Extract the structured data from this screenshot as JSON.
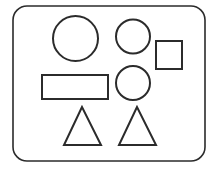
{
  "canvas": {
    "width": 214,
    "height": 169,
    "background": "#ffffff"
  },
  "style": {
    "stroke": "#2b2b2b",
    "stroke_width": 2,
    "fill": "#ffffff"
  },
  "frame": {
    "x": 13,
    "y": 6,
    "width": 192,
    "height": 155,
    "radius": 14
  },
  "shapes": {
    "circle_large": {
      "cx": 75.5,
      "cy": 38.5,
      "r": 22.5
    },
    "circle_top_right": {
      "cx": 133,
      "cy": 36.5,
      "r": 17
    },
    "square": {
      "x": 156,
      "y": 41,
      "width": 26,
      "height": 28
    },
    "rectangle": {
      "x": 42,
      "y": 75,
      "width": 66,
      "height": 24
    },
    "circle_middle_right": {
      "cx": 133,
      "cy": 83,
      "r": 17
    },
    "triangle_left": {
      "points": "82,107 64,145 101,145"
    },
    "triangle_right": {
      "points": "137,107 119,145 156,145"
    }
  }
}
